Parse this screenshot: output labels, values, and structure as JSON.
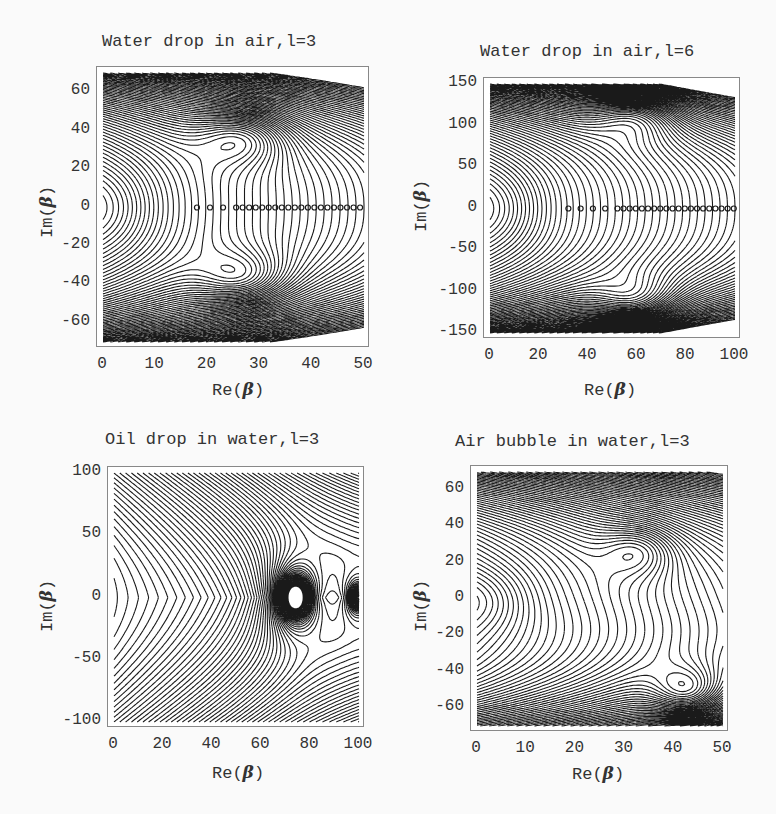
{
  "chart_data": [
    {
      "type": "contour",
      "title": "Water drop in air,l=3",
      "xlabel": "Re(β)",
      "ylabel": "Im(β)",
      "xlim": [
        0,
        50
      ],
      "ylim": [
        -70,
        70
      ],
      "xticks": [
        0,
        10,
        20,
        30,
        40,
        50
      ],
      "yticks": [
        60,
        40,
        20,
        0,
        -20,
        -40,
        -60
      ],
      "grid": false,
      "features": {
        "saddle_minima": [
          {
            "x": 27,
            "y": 37
          },
          {
            "x": 27,
            "y": -37
          }
        ],
        "left_lobe_max_re": 10,
        "real_axis_poles_start": 18,
        "dense_region_top_from": 55,
        "dense_region_bottom_from": -55
      }
    },
    {
      "type": "contour",
      "title": "Water drop in air,l=6",
      "xlabel": "Re(β)",
      "ylabel": "Im(β)",
      "xlim": [
        0,
        100
      ],
      "ylim": [
        -150,
        150
      ],
      "xticks": [
        0,
        20,
        40,
        60,
        80,
        100
      ],
      "yticks": [
        150,
        100,
        50,
        0,
        -50,
        -100,
        -150
      ],
      "grid": false,
      "features": {
        "saddle_minima": [
          {
            "x": 60,
            "y": 113
          },
          {
            "x": 60,
            "y": -113
          }
        ],
        "left_lobe_max_re": 7,
        "real_axis_poles_start": 32,
        "dense_region_top_from": 130,
        "dense_region_bottom_from": -130
      }
    },
    {
      "type": "contour",
      "title": "Oil drop in water,l=3",
      "xlabel": "Re(β)",
      "ylabel": "Im(β)",
      "xlim": [
        0,
        100
      ],
      "ylim": [
        -100,
        100
      ],
      "xticks": [
        0,
        20,
        40,
        60,
        80,
        100
      ],
      "yticks": [
        100,
        50,
        0,
        -50,
        -100
      ],
      "grid": false,
      "features": {
        "pole": {
          "x": 74,
          "y": 0
        },
        "secondary_pole": {
          "x": 100,
          "y": 0
        },
        "left_lobe_max_re": 35
      }
    },
    {
      "type": "contour",
      "title": "Air bubble in water,l=3",
      "xlabel": "Re(β)",
      "ylabel": "Im(β)",
      "xlim": [
        0,
        50
      ],
      "ylim": [
        -70,
        70
      ],
      "xticks": [
        0,
        10,
        20,
        30,
        40,
        50
      ],
      "yticks": [
        60,
        40,
        20,
        0,
        -20,
        -40,
        -60
      ],
      "grid": false,
      "features": {
        "minima": [
          {
            "x": 33,
            "y": 27
          },
          {
            "x": 43,
            "y": -52
          }
        ],
        "left_lobe_max_re": 10,
        "dense_region_top_from": 45,
        "dense_region_bottom_from": -55
      }
    }
  ],
  "panels": [
    {
      "title": "Water drop in air,l=3",
      "xlabel_prefix": "Re(",
      "ylabel_prefix": "Im(",
      "beta": "β",
      "close": ")"
    },
    {
      "title": "Water drop in air,l=6",
      "xlabel_prefix": "Re(",
      "ylabel_prefix": "Im(",
      "beta": "β",
      "close": ")"
    },
    {
      "title": "Oil drop in water,l=3",
      "xlabel_prefix": "Re(",
      "ylabel_prefix": "Im(",
      "beta": "β",
      "close": ")"
    },
    {
      "title": "Air bubble in water,l=3",
      "xlabel_prefix": "Re(",
      "ylabel_prefix": "Im(",
      "beta": "β",
      "close": ")"
    }
  ],
  "colors": {
    "line": "#1a1a1a",
    "frame": "#888888",
    "text": "#333333",
    "background": "#fafafa"
  }
}
